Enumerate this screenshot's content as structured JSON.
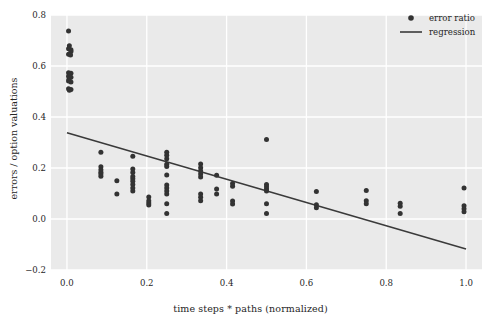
{
  "chart_data": {
    "type": "scatter",
    "title": "",
    "xlabel": "time steps * paths (normalized)",
    "ylabel": "errors / option valuations",
    "xlim": [
      -0.04,
      1.04
    ],
    "ylim": [
      -0.2,
      0.8
    ],
    "xticks": [
      "0.0",
      "0.2",
      "0.4",
      "0.6",
      "0.8",
      "1.0"
    ],
    "xtick_values": [
      0.0,
      0.2,
      0.4,
      0.6,
      0.8,
      1.0
    ],
    "yticks": [
      "-0.2",
      "0.0",
      "0.2",
      "0.4",
      "0.6",
      "0.8"
    ],
    "ytick_values": [
      -0.2,
      0.0,
      0.2,
      0.4,
      0.6,
      0.8
    ],
    "grid": true,
    "grid_color": "#ffffff",
    "panel_color": "#eaeaea",
    "marker_color": "#333333",
    "line_color": "#3a3a3a",
    "legend_position": "top-right",
    "legend": [
      {
        "label": "error ratio",
        "marker": "dot",
        "color": "#333333"
      },
      {
        "label": "regression",
        "marker": "line",
        "color": "#3a3a3a"
      }
    ],
    "series": [
      {
        "name": "error ratio",
        "marker": "dot",
        "color": "#333333",
        "points": [
          [
            0.004,
            0.737
          ],
          [
            0.006,
            0.679
          ],
          [
            0.004,
            0.668
          ],
          [
            0.01,
            0.664
          ],
          [
            0.01,
            0.657
          ],
          [
            0.004,
            0.646
          ],
          [
            0.009,
            0.643
          ],
          [
            0.004,
            0.574
          ],
          [
            0.01,
            0.572
          ],
          [
            0.006,
            0.566
          ],
          [
            0.004,
            0.56
          ],
          [
            0.01,
            0.556
          ],
          [
            0.005,
            0.548
          ],
          [
            0.004,
            0.541
          ],
          [
            0.01,
            0.537
          ],
          [
            0.004,
            0.511
          ],
          [
            0.01,
            0.508
          ],
          [
            0.006,
            0.505
          ],
          [
            0.085,
            0.262
          ],
          [
            0.085,
            0.205
          ],
          [
            0.085,
            0.193
          ],
          [
            0.085,
            0.183
          ],
          [
            0.085,
            0.176
          ],
          [
            0.085,
            0.168
          ],
          [
            0.125,
            0.15
          ],
          [
            0.125,
            0.098
          ],
          [
            0.165,
            0.246
          ],
          [
            0.165,
            0.196
          ],
          [
            0.165,
            0.182
          ],
          [
            0.165,
            0.167
          ],
          [
            0.165,
            0.158
          ],
          [
            0.165,
            0.148
          ],
          [
            0.165,
            0.135
          ],
          [
            0.165,
            0.122
          ],
          [
            0.165,
            0.11
          ],
          [
            0.205,
            0.086
          ],
          [
            0.205,
            0.072
          ],
          [
            0.205,
            0.063
          ],
          [
            0.205,
            0.055
          ],
          [
            0.25,
            0.262
          ],
          [
            0.25,
            0.25
          ],
          [
            0.25,
            0.236
          ],
          [
            0.25,
            0.215
          ],
          [
            0.25,
            0.206
          ],
          [
            0.25,
            0.173
          ],
          [
            0.25,
            0.133
          ],
          [
            0.25,
            0.122
          ],
          [
            0.25,
            0.11
          ],
          [
            0.25,
            0.098
          ],
          [
            0.25,
            0.06
          ],
          [
            0.25,
            0.022
          ],
          [
            0.335,
            0.216
          ],
          [
            0.335,
            0.201
          ],
          [
            0.335,
            0.188
          ],
          [
            0.335,
            0.176
          ],
          [
            0.335,
            0.165
          ],
          [
            0.335,
            0.098
          ],
          [
            0.335,
            0.085
          ],
          [
            0.335,
            0.072
          ],
          [
            0.375,
            0.172
          ],
          [
            0.375,
            0.118
          ],
          [
            0.375,
            0.098
          ],
          [
            0.415,
            0.139
          ],
          [
            0.415,
            0.128
          ],
          [
            0.415,
            0.071
          ],
          [
            0.415,
            0.059
          ],
          [
            0.5,
            0.312
          ],
          [
            0.5,
            0.135
          ],
          [
            0.5,
            0.126
          ],
          [
            0.5,
            0.118
          ],
          [
            0.5,
            0.11
          ],
          [
            0.5,
            0.06
          ],
          [
            0.5,
            0.022
          ],
          [
            0.625,
            0.108
          ],
          [
            0.625,
            0.056
          ],
          [
            0.625,
            0.044
          ],
          [
            0.75,
            0.112
          ],
          [
            0.75,
            0.072
          ],
          [
            0.75,
            0.06
          ],
          [
            0.835,
            0.062
          ],
          [
            0.835,
            0.05
          ],
          [
            0.835,
            0.022
          ],
          [
            0.995,
            0.122
          ],
          [
            0.995,
            0.052
          ],
          [
            0.995,
            0.04
          ],
          [
            0.995,
            0.028
          ]
        ]
      }
    ],
    "regression": {
      "name": "regression",
      "color": "#3a3a3a",
      "x_start": 0.0,
      "y_start": 0.338,
      "x_end": 1.0,
      "y_end": -0.118
    }
  }
}
